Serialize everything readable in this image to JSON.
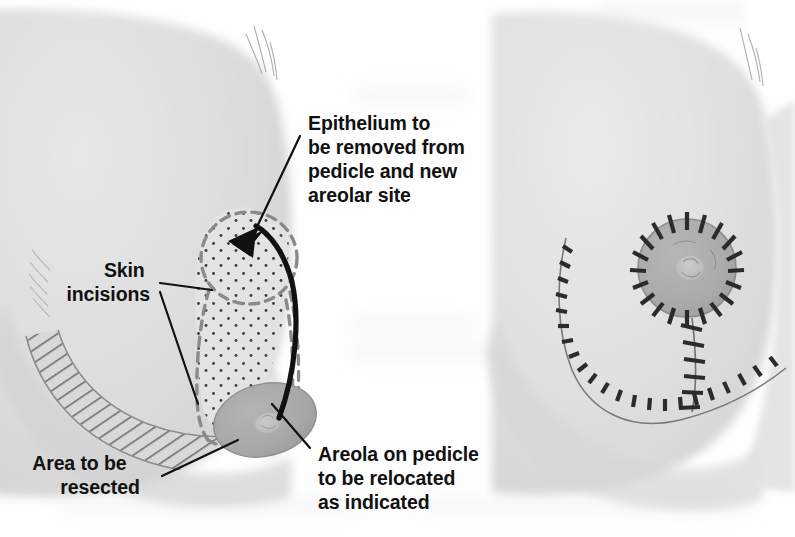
{
  "figure": {
    "kind": "medical-illustration",
    "panel_count": 2,
    "background_color": "#fefefe",
    "ink_color": "#111111"
  },
  "palette": {
    "skin_fill": "#dedede",
    "skin_fill_light": "#e9e9e9",
    "skin_shadow": "#cfcfcf",
    "skin_edge": "#c4c4c4",
    "areola_fill": "#a9a9a9",
    "areola_edge": "#8f8f8f",
    "nipple_fill": "#c2c2c2",
    "pedicle_fill": "#e2e2e2",
    "dash_guide": "#8a8a8a",
    "hatch_line": "#6f6f6f",
    "stipple_dot": "#3a3a3a",
    "suture_ink": "#2b2b2b",
    "ghost_bleed": "#f3f3f3"
  },
  "labels": {
    "epithelium": {
      "id": "epithelium-label",
      "lines": [
        "Epithelium to",
        "be removed from",
        "pedicle and new",
        "areolar site"
      ],
      "x": 308,
      "y": 130,
      "leader": "line from text to top of dashed new-areolar-site circle"
    },
    "skin_incisions": {
      "id": "skin-incisions-label",
      "lines": [
        "Skin",
        "incisions"
      ],
      "x": 150,
      "y": 277,
      "align": "end",
      "leader": "two branching lines to the keyhole pattern outline"
    },
    "area_resected": {
      "id": "area-to-be-resected-label",
      "lines": [
        "Area to be",
        "resected"
      ],
      "x": 100,
      "y": 470,
      "align": "middle",
      "leader": "line up-right into the cross-hatched crescent"
    },
    "areola_pedicle": {
      "id": "areola-on-pedicle-label",
      "lines": [
        "Areola on pedicle",
        "to be relocated",
        "as indicated"
      ],
      "x": 318,
      "y": 461,
      "leader": "line up-left to the shaded areola on the pedicle"
    }
  },
  "left_panel": {
    "name": "preoperative-markings",
    "features": [
      {
        "id": "breast-silhouette",
        "label": "breast and chest wall silhouette"
      },
      {
        "id": "keyhole-pattern",
        "label": "dashed keyhole skin incision pattern"
      },
      {
        "id": "new-areolar-site",
        "label": "dashed circle marking the new areolar site"
      },
      {
        "id": "stippled-pedicle",
        "label": "stippled de-epithelialized pedicle"
      },
      {
        "id": "resection-hatch",
        "label": "cross-hatched area to be resected"
      },
      {
        "id": "areola",
        "label": "areola on the inferior pedicle"
      },
      {
        "id": "transposition-arrow",
        "label": "curved arrow showing areolar transposition"
      }
    ]
  },
  "right_panel": {
    "name": "postoperative-result",
    "features": [
      {
        "id": "breast-silhouette",
        "label": "breast and chest wall silhouette"
      },
      {
        "id": "periareolar-suture-line",
        "label": "circular periareolar suture line"
      },
      {
        "id": "vertical-suture-line",
        "label": "vertical suture line"
      },
      {
        "id": "inframammary-suture-line",
        "label": "inframammary curved suture line"
      },
      {
        "id": "areola",
        "label": "repositioned areola with nipple"
      }
    ]
  }
}
